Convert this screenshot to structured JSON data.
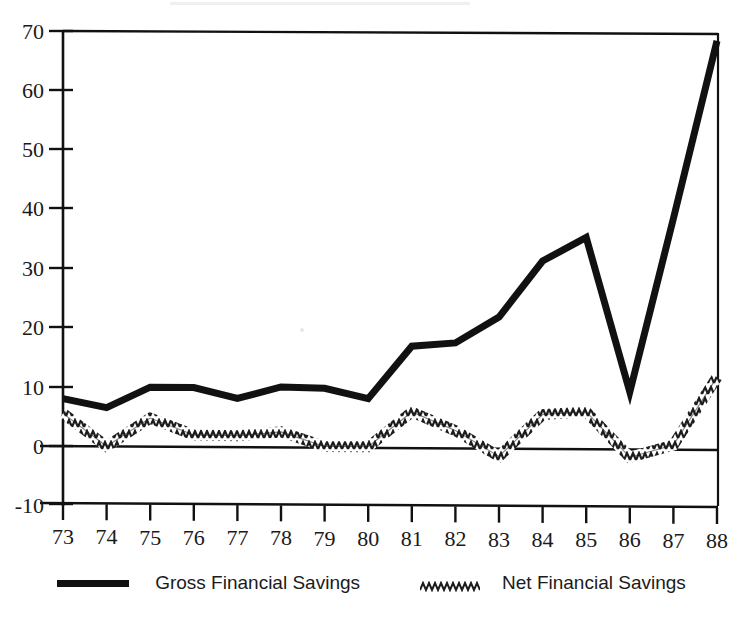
{
  "chart_data": {
    "type": "line",
    "title": "",
    "subtitle": "",
    "xlabel": "",
    "ylabel": "",
    "x": [
      "73",
      "74",
      "75",
      "76",
      "77",
      "78",
      "79",
      "80",
      "81",
      "82",
      "83",
      "84",
      "85",
      "86",
      "87",
      "88"
    ],
    "xtick_labels": [
      "73",
      "74",
      "75",
      "76",
      "77",
      "78",
      "79",
      "80",
      "81",
      "82",
      "83",
      "84",
      "85",
      "86",
      "87",
      "88"
    ],
    "ytick_labels": [
      "70",
      "60",
      "50",
      "40",
      "30",
      "20",
      "10",
      "0",
      "-10"
    ],
    "ytick_values": [
      70,
      60,
      50,
      40,
      30,
      20,
      10,
      0,
      -10
    ],
    "ylim": [
      -10,
      70
    ],
    "grid": false,
    "legend_position": "bottom",
    "zero_line": true,
    "series": [
      {
        "name": "Gross Financial Savings",
        "style": "thick-solid",
        "color": "#111111",
        "values": [
          8.0,
          6.5,
          10.0,
          10.0,
          8.2,
          10.2,
          10.0,
          8.3,
          17.2,
          17.8,
          22.2,
          31.7,
          35.7,
          9.7,
          39.0,
          69.0
        ]
      },
      {
        "name": "Net Financial Savings",
        "style": "thin-zigzag",
        "color": "#222222",
        "values": [
          5.5,
          0.0,
          4.8,
          2.0,
          1.9,
          2.6,
          0.2,
          0.2,
          6.1,
          3.0,
          -1.3,
          5.8,
          6.3,
          -1.3,
          0.8,
          12.3
        ]
      }
    ]
  },
  "legend": {
    "entries": [
      {
        "label": "Gross Financial Savings",
        "swatch": "thick-line-swatch"
      },
      {
        "label": "Net Financial Savings",
        "swatch": "zigzag-line-swatch"
      }
    ]
  },
  "axis": {
    "y_axis_name": "y-axis",
    "x_axis_name": "x-axis"
  },
  "colors": {
    "ink": "#111111",
    "background": "#ffffff"
  }
}
